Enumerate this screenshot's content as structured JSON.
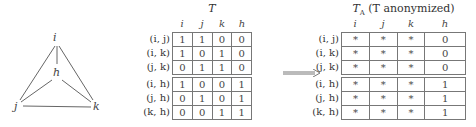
{
  "graph": {
    "nodes": [
      {
        "id": "i",
        "label": "i"
      },
      {
        "id": "h",
        "label": "h"
      },
      {
        "id": "j",
        "label": "j"
      },
      {
        "id": "k",
        "label": "k"
      }
    ],
    "edges": [
      [
        "i",
        "j"
      ],
      [
        "i",
        "k"
      ],
      [
        "i",
        "h"
      ],
      [
        "j",
        "k"
      ],
      [
        "j",
        "h"
      ],
      [
        "k",
        "h"
      ]
    ]
  },
  "table_T": {
    "title": "T",
    "columns": [
      "i",
      "j",
      "k",
      "h"
    ],
    "row_labels": [
      "(i, j)",
      "(i, k)",
      "(j, k)",
      "(i, h)",
      "(j, h)",
      "(k, h)"
    ],
    "rows": [
      [
        "1",
        "1",
        "0",
        "0"
      ],
      [
        "1",
        "0",
        "1",
        "0"
      ],
      [
        "0",
        "1",
        "1",
        "0"
      ],
      [
        "1",
        "0",
        "0",
        "1"
      ],
      [
        "0",
        "1",
        "0",
        "1"
      ],
      [
        "0",
        "0",
        "1",
        "1"
      ]
    ]
  },
  "arrow": {
    "label": "implies-arrow"
  },
  "table_TA": {
    "title_main": "T",
    "title_sub": "A",
    "title_paren": "(T anonymized)",
    "columns": [
      "i",
      "j",
      "k",
      "h"
    ],
    "row_labels": [
      "(i, j)",
      "(i, k)",
      "(j, k)",
      "(i, h)",
      "(j, h)",
      "(k, h)"
    ],
    "rows": [
      [
        "*",
        "*",
        "*",
        "0"
      ],
      [
        "*",
        "*",
        "*",
        "0"
      ],
      [
        "*",
        "*",
        "*",
        "0"
      ],
      [
        "*",
        "*",
        "*",
        "1"
      ],
      [
        "*",
        "*",
        "*",
        "1"
      ],
      [
        "*",
        "*",
        "*",
        "1"
      ]
    ]
  }
}
